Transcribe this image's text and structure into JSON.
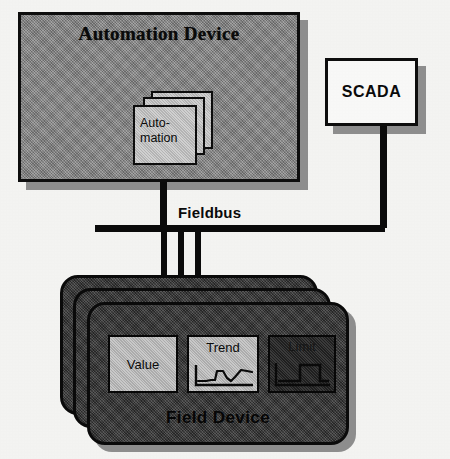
{
  "diagram": {
    "background_color": "#f6f6f4",
    "line_color": "#0b0b0b"
  },
  "automation_device": {
    "title": "Automation Device",
    "fill_color": "#8a8a8a",
    "border_color": "#0d0d0d",
    "shadow_color": "#8f8f8f",
    "card_stack": {
      "label": "Auto-\nmation",
      "label_line1": "Auto-",
      "label_line2": "mation",
      "card_count": 3,
      "fill_color": "#c4c4c4"
    }
  },
  "scada": {
    "label": "SCADA",
    "fill_color": "#fbfbfa",
    "border_color": "#0d0d0d",
    "shadow_color": "#8f8f8f"
  },
  "fieldbus": {
    "label": "Fieldbus",
    "color": "#0b0b0b",
    "drop_count": 3
  },
  "field_device": {
    "label": "Field Device",
    "card_count": 3,
    "fill_color": "#3b3b3b",
    "border_color": "#0a0a0a",
    "functions": [
      {
        "label": "Value",
        "style": "light",
        "glyph": "text-only-icon"
      },
      {
        "label": "Trend",
        "style": "light",
        "glyph": "line-chart-icon"
      },
      {
        "label": "Limit",
        "style": "dark",
        "glyph": "step-function-icon"
      }
    ]
  }
}
